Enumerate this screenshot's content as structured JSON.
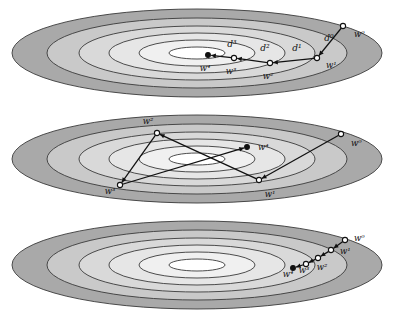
{
  "figure": {
    "title": "",
    "panel_count": 3,
    "colors": {
      "band_outer": "#a9a9a9",
      "band_2": "#c9c9c9",
      "band_3": "#d9d9d9",
      "band_4": "#e6e6e6",
      "band_5": "#f0f0f0",
      "band_core": "#ffffff",
      "stroke": "#3a3a3a",
      "path": "#111111",
      "marker_fill": "#ffffff",
      "marker_stroke": "#111111",
      "background": "#ffffff"
    },
    "contour": {
      "description": "nested concentric ellipses forming a level-set bowl",
      "ring_count": 6,
      "ring_rx": [
        185,
        150,
        118,
        88,
        58,
        28
      ],
      "ring_ry": [
        44,
        35,
        27,
        20,
        13,
        6
      ]
    }
  },
  "panels": [
    {
      "id": "panel-top",
      "name": "panel-top",
      "caption": "",
      "path_kind": "polyline-with-step-labels",
      "points": [
        {
          "label": "w⁰",
          "label_name": "w0",
          "x": 343,
          "y": 26,
          "label_x": 354,
          "label_y": 37,
          "anchor": "start"
        },
        {
          "label": "w¹",
          "label_name": "w1",
          "x": 317,
          "y": 58,
          "label_x": 326,
          "label_y": 68,
          "anchor": "start"
        },
        {
          "label": "w²",
          "label_name": "w2",
          "x": 270,
          "y": 63,
          "label_x": 268,
          "label_y": 79,
          "anchor": "middle"
        },
        {
          "label": "w³",
          "label_name": "w3",
          "x": 234,
          "y": 58,
          "label_x": 231,
          "label_y": 74,
          "anchor": "middle"
        },
        {
          "label": "w⁴",
          "label_name": "w4",
          "x": 208,
          "y": 55,
          "label_x": 205,
          "label_y": 71,
          "anchor": "middle"
        }
      ],
      "step_labels": [
        {
          "label": "d⁰",
          "label_name": "d0",
          "x": 329,
          "y": 41
        },
        {
          "label": "d¹",
          "label_name": "d1",
          "x": 297,
          "y": 51
        },
        {
          "label": "d²",
          "label_name": "d2",
          "x": 265,
          "y": 51
        },
        {
          "label": "d³",
          "label_name": "d3",
          "x": 232,
          "y": 47
        }
      ]
    },
    {
      "id": "panel-mid",
      "name": "panel-mid",
      "caption": "",
      "path_kind": "zigzag-polyline",
      "points": [
        {
          "label": "w⁰",
          "label_name": "w0",
          "x": 341,
          "y": 28,
          "label_x": 351,
          "label_y": 40,
          "anchor": "start"
        },
        {
          "label": "w¹",
          "label_name": "w1",
          "x": 259,
          "y": 74,
          "label_x": 270,
          "label_y": 91,
          "anchor": "middle"
        },
        {
          "label": "w²",
          "label_name": "w2",
          "x": 157,
          "y": 27,
          "label_x": 148,
          "label_y": 18,
          "anchor": "middle"
        },
        {
          "label": "w³",
          "label_name": "w3",
          "x": 120,
          "y": 79,
          "label_x": 110,
          "label_y": 88,
          "anchor": "middle"
        },
        {
          "label": "w⁴",
          "label_name": "w4",
          "x": 247,
          "y": 41,
          "label_x": 258,
          "label_y": 44,
          "anchor": "start"
        }
      ],
      "step_labels": []
    },
    {
      "id": "panel-bot",
      "name": "panel-bot",
      "caption": "",
      "path_kind": "short-chain-polyline",
      "points": [
        {
          "label": "w⁰",
          "label_name": "w0",
          "x": 345,
          "y": 28,
          "label_x": 354,
          "label_y": 29,
          "anchor": "start"
        },
        {
          "label": "w¹",
          "label_name": "w1",
          "x": 331,
          "y": 38,
          "label_x": 340,
          "label_y": 42,
          "anchor": "start"
        },
        {
          "label": "w²",
          "label_name": "w2",
          "x": 318,
          "y": 46,
          "label_x": 322,
          "label_y": 58,
          "anchor": "middle"
        },
        {
          "label": "w³",
          "label_name": "w3",
          "x": 306,
          "y": 52,
          "label_x": 304,
          "label_y": 61,
          "anchor": "middle"
        },
        {
          "label": "w⁴",
          "label_name": "w4",
          "x": 293,
          "y": 56,
          "label_x": 288,
          "label_y": 65,
          "anchor": "middle"
        }
      ],
      "step_labels": []
    }
  ]
}
